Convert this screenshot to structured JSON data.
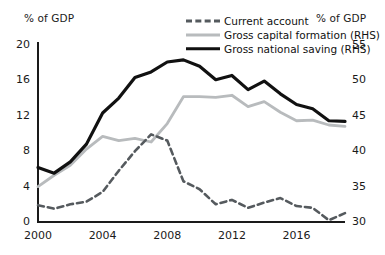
{
  "chart_data": {
    "type": "line",
    "title": "",
    "subtitle": "",
    "xlabel": "",
    "ylabel": "% of GDP",
    "y2label": "% of GDP",
    "grid": false,
    "legend_position": "top-right",
    "x": [
      2000,
      2001,
      2002,
      2003,
      2004,
      2005,
      2006,
      2007,
      2008,
      2009,
      2010,
      2011,
      2012,
      2013,
      2014,
      2015,
      2016,
      2017,
      2018,
      2019
    ],
    "xlim": [
      2000,
      2019
    ],
    "xticks": [
      2000,
      2004,
      2008,
      2012,
      2016
    ],
    "xtick_labels": [
      "2000",
      "2004",
      "2008",
      "2012",
      "2016"
    ],
    "ylim": [
      0,
      20
    ],
    "yticks": [
      0,
      4,
      8,
      12,
      16,
      20
    ],
    "ytick_labels": [
      "0",
      "4",
      "8",
      "12",
      "16",
      "20"
    ],
    "y2lim": [
      30,
      55
    ],
    "y2ticks": [
      30,
      35,
      40,
      45,
      50,
      55
    ],
    "y2tick_labels": [
      "30",
      "35",
      "40",
      "45",
      "50",
      "55"
    ],
    "series": [
      {
        "name": "Current account",
        "axis": "left",
        "style": "dashed",
        "color": "#555a5e",
        "values": [
          1.9,
          1.5,
          2.0,
          2.3,
          3.4,
          5.8,
          8.0,
          9.9,
          9.2,
          4.6,
          3.7,
          2.0,
          2.5,
          1.6,
          2.2,
          2.7,
          1.8,
          1.6,
          0.2,
          1.0
        ]
      },
      {
        "name": "Gross capital formation (RHS)",
        "axis": "right",
        "style": "solid",
        "color": "#b8bbbd",
        "values": [
          35.0,
          36.6,
          38.0,
          40.3,
          42.1,
          41.5,
          41.8,
          41.3,
          43.9,
          47.7,
          47.7,
          47.6,
          47.9,
          46.3,
          47.0,
          45.5,
          44.3,
          44.4,
          43.7,
          43.5
        ]
      },
      {
        "name": "Gross national saving (RHS)",
        "axis": "right",
        "style": "solid",
        "color": "#111111",
        "values": [
          37.7,
          36.9,
          38.5,
          41.0,
          45.4,
          47.5,
          50.4,
          51.2,
          52.6,
          52.9,
          52.0,
          50.1,
          50.7,
          48.7,
          49.9,
          48.1,
          46.6,
          46.0,
          44.3,
          44.2
        ]
      }
    ]
  },
  "axes": {
    "left_title": "% of GDP",
    "right_title": "% of GDP"
  },
  "legend": {
    "items": [
      {
        "label": "Current account",
        "swatch": "dashed-line-swatch"
      },
      {
        "label": "Gross capital formation (RHS)",
        "swatch": "grey-line-swatch"
      },
      {
        "label": "Gross national saving (RHS)",
        "swatch": "black-line-swatch"
      }
    ]
  },
  "colors": {
    "current_account": "#555a5e",
    "gross_capital_formation": "#b8bbbd",
    "gross_national_saving": "#111111",
    "axis": "#1a1a1a",
    "background": "#ffffff"
  }
}
